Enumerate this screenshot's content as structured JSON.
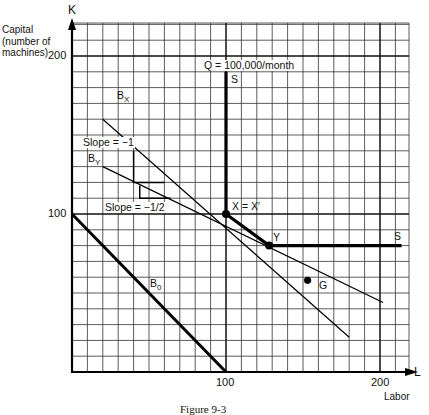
{
  "figure": {
    "caption": "Figure 9-3",
    "y_axis": {
      "symbol": "K",
      "label_lines": [
        "Capital",
        "(number of",
        "machines)"
      ],
      "ticks": [
        "100",
        "200"
      ]
    },
    "x_axis": {
      "symbol": "L",
      "label": "Labor",
      "ticks": [
        "100",
        "200"
      ]
    },
    "isoquant_label": "Q = 100,000/month",
    "labels": {
      "s_top": "S",
      "s_right": "S",
      "bx": "B",
      "bx_sub": "X",
      "by": "B",
      "by_sub": "Y",
      "b0": "B",
      "b0_sub": "0",
      "slope1": "Slope = −1",
      "slope2": "Slope = −1/2",
      "x_point": "X = X′",
      "y_point": "Y",
      "g_point": "G"
    }
  },
  "chart_data": {
    "type": "line",
    "title": "",
    "xlabel": "Labor (L)",
    "ylabel": "Capital (number of machines) (K)",
    "xlim": [
      0,
      220
    ],
    "ylim": [
      0,
      220
    ],
    "grid": true,
    "grid_step": 10,
    "series": [
      {
        "name": "Isoquant S (Q = 100,000/month)",
        "points": [
          [
            100,
            190
          ],
          [
            100,
            100
          ],
          [
            128,
            80
          ],
          [
            214,
            80
          ]
        ]
      },
      {
        "name": "B_X",
        "slope": -1,
        "points": [
          [
            20,
            160
          ],
          [
            180,
            22
          ]
        ]
      },
      {
        "name": "B_Y",
        "slope": -0.5,
        "points": [
          [
            20,
            130
          ],
          [
            202,
            44
          ]
        ]
      },
      {
        "name": "B_0",
        "slope": -1,
        "points": [
          [
            0,
            100
          ],
          [
            100,
            0
          ]
        ]
      }
    ],
    "points": [
      {
        "name": "X = X'",
        "x": 100,
        "y": 100
      },
      {
        "name": "Y",
        "x": 128,
        "y": 80
      },
      {
        "name": "G",
        "x": 153,
        "y": 58
      }
    ],
    "annotations": [
      "Q = 100,000/month",
      "Slope = -1",
      "Slope = -1/2",
      "S",
      "S"
    ]
  }
}
